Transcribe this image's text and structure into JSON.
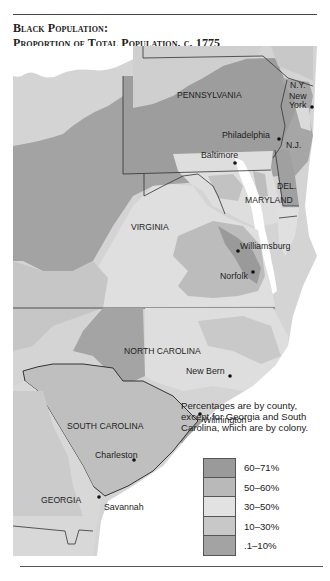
{
  "title": {
    "line1": "Black Population:",
    "line2": "Proportion of Total Population, c. 1775"
  },
  "map": {
    "region_labels": {
      "ny": "N.Y.",
      "pennsylvania": "PENNSYLVANIA",
      "nj": "N.J.",
      "del": "DEL.",
      "maryland": "MARYLAND",
      "virginia": "VIRGINIA",
      "north_carolina": "NORTH CAROLINA",
      "south_carolina": "SOUTH CAROLINA",
      "georgia": "GEORGIA"
    },
    "cities": {
      "new_york_1": "New",
      "new_york_2": "York",
      "philadelphia": "Philadelphia",
      "baltimore": "Baltimore",
      "williamsburg": "Williamsburg",
      "norfolk": "Norfolk",
      "new_bern": "New Bern",
      "wilmington": "Wilmington",
      "charleston": "Charleston",
      "savannah": "Savannah"
    }
  },
  "note": "Percentages are by county, except for Georgia and South Carolina, which are by colony.",
  "legend": {
    "items": [
      {
        "label": "60–71%",
        "color": "#9a9a9a"
      },
      {
        "label": "50–60%",
        "color": "#b9b9b9"
      },
      {
        "label": "30–50%",
        "color": "#e2e2e2"
      },
      {
        "label": "10–30%",
        "color": "#c8c8c8"
      },
      {
        "label": ".1–10%",
        "color": "#a3a3a3"
      }
    ]
  },
  "colors": {
    "band_60_71": "#9a9a9a",
    "band_50_60": "#b9b9b9",
    "band_30_50": "#e2e2e2",
    "band_10_30": "#c8c8c8",
    "band_01_10": "#a3a3a3",
    "unsettled": "#d4d4d4",
    "water": "#ffffff"
  }
}
